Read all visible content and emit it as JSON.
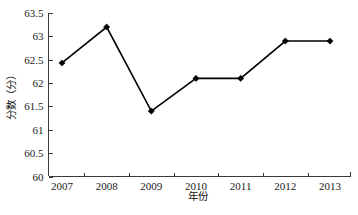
{
  "chart_data": {
    "type": "line",
    "title": "",
    "subtitle": "",
    "xlabel": "年份",
    "ylabel": "分数（分）",
    "categories": [
      "2007",
      "2008",
      "2009",
      "2010",
      "2011",
      "2012",
      "2013"
    ],
    "values": [
      62.43,
      63.2,
      61.4,
      62.1,
      62.1,
      62.9,
      62.9
    ],
    "series": [
      {
        "name": "分数",
        "values": [
          62.43,
          63.2,
          61.4,
          62.1,
          62.1,
          62.9,
          62.9
        ]
      }
    ],
    "ylim": [
      60,
      63.5
    ],
    "ytick_labels": [
      "60",
      "60.5",
      "61",
      "61.5",
      "62",
      "62.5",
      "63",
      "63.5"
    ],
    "ytick_values": [
      60,
      60.5,
      61,
      61.5,
      62,
      62.5,
      63,
      63.5
    ],
    "xtick_labels": [
      "2007",
      "2008",
      "2009",
      "2010",
      "2011",
      "2012",
      "2013"
    ],
    "grid": false,
    "legend": null,
    "legend_position": "none",
    "marker": "diamond",
    "line_color": "#000000",
    "marker_color": "#000000",
    "background_color": "#ffffff",
    "annotations": []
  },
  "footer": {
    "cropped_text": "· · · · · · · · · · · · · · · · · · · · · · · · · · · ·"
  }
}
